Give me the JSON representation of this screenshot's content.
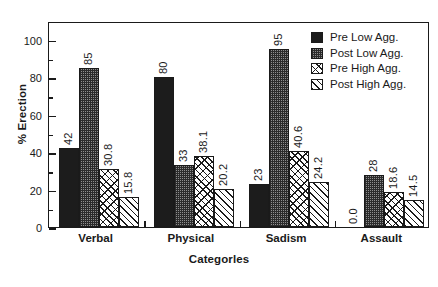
{
  "chart_data": {
    "type": "bar",
    "title": "",
    "xlabel": "Categorles",
    "ylabel": "% Erection",
    "ylim": [
      0,
      110
    ],
    "yticks": [
      0,
      20,
      40,
      60,
      80,
      100
    ],
    "grid": false,
    "legend_position": "top-right-inside",
    "categories": [
      "Verbal",
      "Physical",
      "Sadism",
      "Assault"
    ],
    "series": [
      {
        "name": "Pre Low Agg.",
        "pattern": "solid-black",
        "values": [
          42,
          80,
          23,
          0.0
        ],
        "labels": [
          "42",
          "80",
          "23",
          "0.0"
        ]
      },
      {
        "name": "Post Low Agg.",
        "pattern": "stipple",
        "values": [
          85,
          33,
          95,
          28
        ],
        "labels": [
          "85",
          "33",
          "95",
          "28"
        ]
      },
      {
        "name": "Pre High Agg.",
        "pattern": "cross-hatch",
        "values": [
          30.8,
          38.1,
          40.6,
          18.6
        ],
        "labels": [
          "30.8",
          "38.1",
          "40.6",
          "18.6"
        ]
      },
      {
        "name": "Post High Agg.",
        "pattern": "diagonal-line",
        "values": [
          15.8,
          20.2,
          24.2,
          14.5
        ],
        "labels": [
          "15.8",
          "20.2",
          "24.2",
          "14.5"
        ]
      }
    ],
    "colors": {
      "axis": "#1a1a1a",
      "background": "#ffffff",
      "series_solid": "#1c1c1c",
      "series_stipple": "#8e8e8e",
      "series_hatch": "#ffffff"
    }
  },
  "legend": {
    "items": [
      {
        "label": "Pre Low Agg."
      },
      {
        "label": "Post Low Agg."
      },
      {
        "label": "Pre High Agg."
      },
      {
        "label": "Post High Agg."
      }
    ]
  },
  "axes": {
    "y_title": "% Erection",
    "x_title": "Categorles",
    "y_tick_labels": [
      "100",
      "80",
      "60",
      "40",
      "20",
      "0"
    ]
  }
}
